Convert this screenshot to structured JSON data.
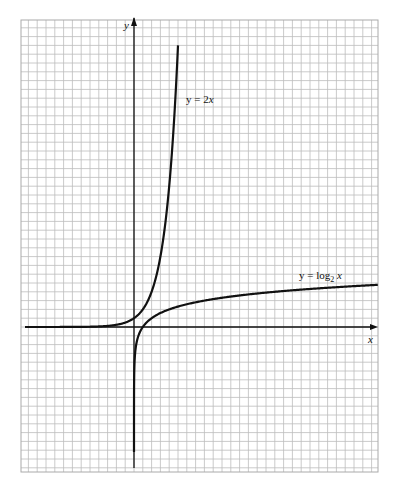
{
  "figure": {
    "type": "function-graph-on-grid-paper",
    "grid": {
      "x_start": 21,
      "y_start": 20,
      "x_end": 378,
      "y_end": 472,
      "cell": 8.8,
      "color": "#bdbdbd"
    },
    "axes": {
      "origin_px": [
        134,
        327
      ],
      "unit_px": 8.8,
      "x_label": "x",
      "y_label": "y",
      "color": "#111111"
    },
    "curves": [
      {
        "name": "exponential",
        "label": "y = 2x",
        "label_base": "y = 2",
        "label_exp": "x",
        "function": "2^x"
      },
      {
        "name": "logarithm",
        "label": "y = log2 x",
        "label_prefix": "y = log",
        "label_sub": "2",
        "label_var": "x",
        "function": "log2(x)"
      }
    ]
  },
  "labels": {
    "y_axis": "y",
    "x_axis": "x",
    "exp_curve": "y = 2x",
    "log_prefix": "y = log",
    "log_sub": "2",
    "log_var": "x"
  }
}
